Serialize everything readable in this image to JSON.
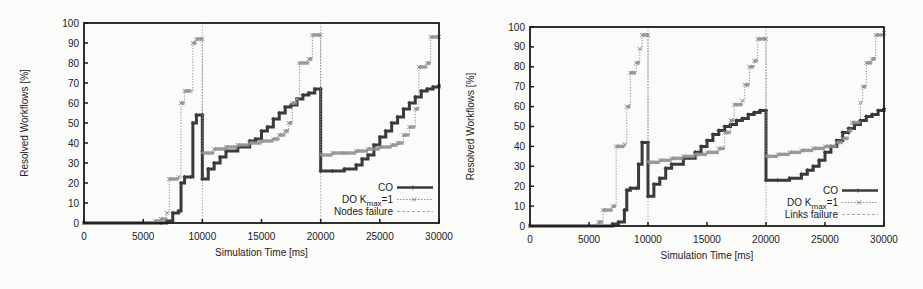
{
  "chart_data": [
    {
      "type": "line",
      "title": "",
      "xlabel": "Simulation Time [ms]",
      "ylabel": "Resolved Workflows [%]",
      "xlim": [
        0,
        30000
      ],
      "ylim": [
        0,
        100
      ],
      "xticks": [
        0,
        5000,
        10000,
        15000,
        20000,
        25000,
        30000
      ],
      "yticks": [
        0,
        10,
        20,
        30,
        40,
        50,
        60,
        70,
        80,
        90,
        100
      ],
      "legend_position": "lower right",
      "failure_label": "Nodes failure",
      "failure_times": [
        10000,
        20000
      ],
      "series": [
        {
          "name": "CO",
          "style": "solid-dark-plus",
          "x": [
            0,
            6500,
            7000,
            7500,
            8000,
            8200,
            8500,
            9000,
            9200,
            9500,
            10000,
            10000,
            10500,
            11000,
            11500,
            12000,
            13000,
            14000,
            14500,
            15000,
            15500,
            16000,
            16500,
            17000,
            17500,
            18000,
            18500,
            19000,
            19500,
            20000,
            20000,
            21000,
            22000,
            23000,
            23500,
            24000,
            24500,
            25000,
            25500,
            26000,
            26500,
            27000,
            27500,
            28000,
            28500,
            29000,
            29500,
            30000
          ],
          "y": [
            0,
            0,
            1,
            5,
            6,
            20,
            23,
            23,
            50,
            54,
            54,
            22,
            27,
            30,
            33,
            36,
            38,
            41,
            42,
            46,
            48,
            52,
            55,
            58,
            59,
            62,
            64,
            65,
            67,
            67,
            26,
            26,
            27,
            29,
            32,
            34,
            39,
            43,
            46,
            50,
            53,
            57,
            60,
            63,
            66,
            67,
            68,
            69
          ]
        },
        {
          "name": "DO K_max=1",
          "legend_main": "DO K",
          "legend_sub": "max",
          "legend_tail": "=1",
          "style": "dotted-gray-x",
          "x": [
            0,
            6000,
            6500,
            7000,
            7200,
            8000,
            8200,
            8500,
            9000,
            9200,
            9500,
            10000,
            10000,
            11000,
            12000,
            13000,
            14000,
            15000,
            16000,
            16500,
            17000,
            17300,
            17600,
            18000,
            18200,
            19000,
            19300,
            20000,
            20000,
            21000,
            22000,
            23000,
            24000,
            25000,
            26000,
            26500,
            27000,
            27500,
            28000,
            28300,
            29000,
            29300,
            30000
          ],
          "y": [
            0,
            1,
            2,
            5,
            22,
            23,
            60,
            66,
            66,
            90,
            92,
            92,
            35,
            37,
            38,
            39,
            40,
            41,
            42,
            44,
            46,
            50,
            60,
            62,
            80,
            82,
            94,
            94,
            34,
            35,
            35,
            36,
            37,
            38,
            39,
            40,
            44,
            48,
            57,
            78,
            80,
            93,
            93
          ]
        }
      ]
    },
    {
      "type": "line",
      "title": "",
      "xlabel": "Simulation Time [ms]",
      "ylabel": "Resolved Workflows [%]",
      "xlim": [
        0,
        30000
      ],
      "ylim": [
        0,
        100
      ],
      "xticks": [
        0,
        5000,
        10000,
        15000,
        20000,
        25000,
        30000
      ],
      "yticks": [
        0,
        10,
        20,
        30,
        40,
        50,
        60,
        70,
        80,
        90,
        100
      ],
      "legend_position": "lower right",
      "failure_label": "Links failure",
      "failure_times": [
        10000,
        20000
      ],
      "series": [
        {
          "name": "CO",
          "style": "solid-dark-plus",
          "x": [
            0,
            7000,
            7500,
            8000,
            8200,
            8500,
            9000,
            9200,
            9500,
            10000,
            10000,
            10500,
            11000,
            11500,
            12000,
            13000,
            14000,
            14500,
            15000,
            15500,
            16000,
            16500,
            17000,
            17500,
            18000,
            18500,
            19000,
            19500,
            20000,
            20000,
            21000,
            22000,
            23000,
            23500,
            24000,
            24500,
            25000,
            25500,
            26000,
            26500,
            27000,
            27500,
            28000,
            28500,
            29000,
            29500,
            30000
          ],
          "y": [
            0,
            1,
            2,
            8,
            18,
            19,
            19,
            31,
            42,
            42,
            15,
            21,
            24,
            29,
            31,
            34,
            37,
            40,
            43,
            46,
            48,
            50,
            51,
            53,
            54,
            56,
            57,
            58,
            58,
            23,
            23,
            24,
            26,
            28,
            30,
            33,
            37,
            40,
            43,
            47,
            49,
            51,
            53,
            55,
            56,
            58,
            59
          ]
        },
        {
          "name": "DO K_max=1",
          "legend_main": "DO K",
          "legend_sub": "max",
          "legend_tail": "=1",
          "style": "dotted-gray-x",
          "x": [
            0,
            5800,
            6200,
            7000,
            7300,
            8000,
            8200,
            8500,
            9000,
            9300,
            9500,
            10000,
            10000,
            11000,
            12000,
            13000,
            14000,
            15000,
            16000,
            16500,
            17000,
            17300,
            18000,
            18200,
            18600,
            19000,
            19300,
            20000,
            20000,
            21000,
            22000,
            23000,
            24000,
            25000,
            26000,
            26500,
            27000,
            27300,
            28000,
            28200,
            28500,
            29000,
            29300,
            30000
          ],
          "y": [
            0,
            2,
            8,
            10,
            40,
            41,
            60,
            77,
            82,
            89,
            96,
            96,
            32,
            33,
            34,
            35,
            36,
            37,
            39,
            47,
            53,
            61,
            63,
            71,
            80,
            83,
            94,
            94,
            35,
            36,
            37,
            38,
            39,
            40,
            42,
            44,
            48,
            52,
            62,
            70,
            82,
            84,
            96,
            97
          ]
        }
      ]
    }
  ],
  "colors": {
    "co_line": "#3a3a3a",
    "do_line": "#8e8e8e",
    "failure_line": "#a8a8a8",
    "frame": "#1a1a1a",
    "background": "#fbfbfa"
  },
  "layout": [
    {
      "x0": 84,
      "x1": 439,
      "y0": 223,
      "y100": 23
    },
    {
      "x0": 530,
      "x1": 884,
      "y0": 226,
      "y100": 27
    }
  ]
}
